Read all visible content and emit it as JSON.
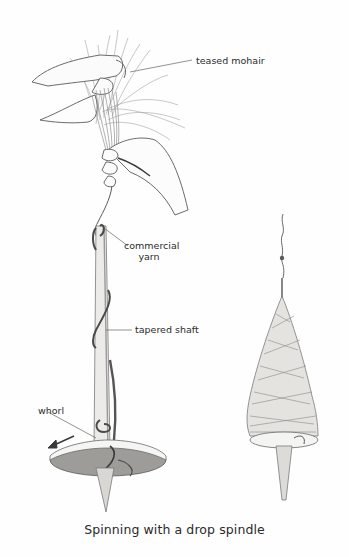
{
  "figure": {
    "caption": "Spinning with a drop spindle",
    "labels": {
      "teased_mohair": "teased mohair",
      "commercial_yarn_line1": "commercial",
      "commercial_yarn_line2": "yarn",
      "tapered_shaft": "tapered shaft",
      "whorl": "whorl"
    },
    "colors": {
      "background": "#fefefe",
      "ink": "#2b2b2b",
      "pencil_dark": "#4a4a4a",
      "pencil_mid": "#8a8a8a",
      "pencil_light": "#c4c4c4",
      "whorl_fill": "#9a9a96"
    },
    "illustrations": [
      {
        "name": "hands-drafting-mohair-with-spindle",
        "description": "two hands drafting teased mohair onto a drop spindle with whorl"
      },
      {
        "name": "full-spindle-cop",
        "description": "drop spindle wound with a cone of spun yarn"
      }
    ]
  }
}
